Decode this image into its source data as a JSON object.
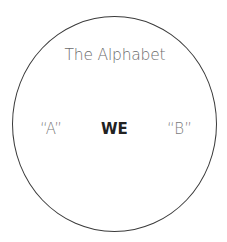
{
  "diagram": {
    "shape": "circle",
    "border_color": "#3a3a3a",
    "title": "The Alphabet",
    "labels": {
      "left": "“A”",
      "center": "WE",
      "right": "“B”"
    },
    "colors": {
      "title": "#6b6b6b",
      "side_labels": "#7a7a7a",
      "center_label": "#222222"
    }
  }
}
